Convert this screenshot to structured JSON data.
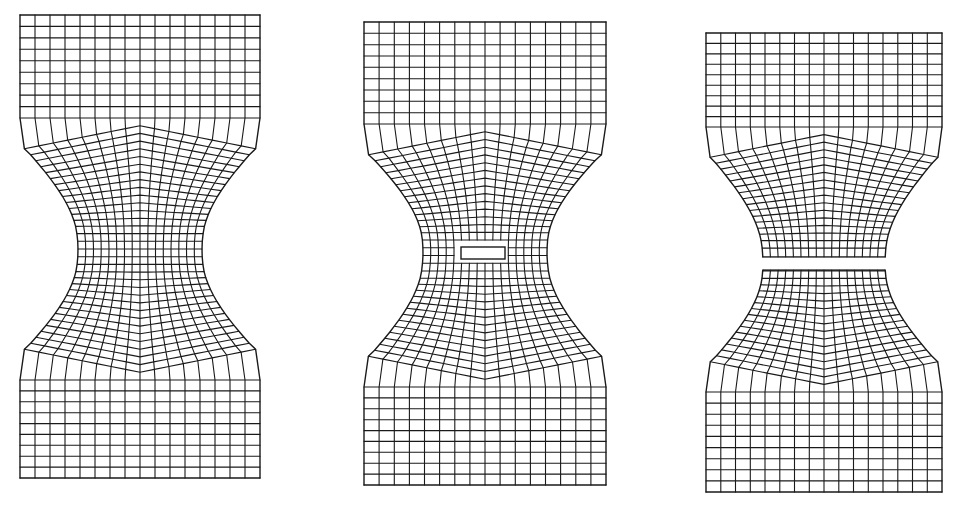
{
  "figure": {
    "width": 958,
    "height": 506,
    "background": "#ffffff",
    "stroke_color": "#1a1a1a",
    "stroke_width": 1.1,
    "outline_width": 1.4
  },
  "specimens": [
    {
      "id": "intact",
      "label": "Intact dog-bone specimen mesh",
      "x0": 20,
      "x1": 260,
      "y0": 15,
      "y1": 478,
      "shoulder_top": 118,
      "shoulder_bottom": 380,
      "waist_y": 250,
      "waist_inset": 58,
      "cols": 16,
      "grip_rows": 9,
      "defect": {
        "type": "none"
      }
    },
    {
      "id": "with-void",
      "label": "Specimen mesh with central void",
      "x0": 364,
      "x1": 606,
      "y0": 22,
      "y1": 485,
      "shoulder_top": 124,
      "shoulder_bottom": 387,
      "waist_y": 252,
      "waist_inset": 59,
      "cols": 16,
      "grip_rows": 9,
      "defect": {
        "type": "void",
        "x": 461,
        "y": 247,
        "w": 44,
        "h": 12
      }
    },
    {
      "id": "fractured",
      "label": "Fractured specimen mesh with transverse crack",
      "x0": 706,
      "x1": 942,
      "y0": 33,
      "y1": 492,
      "shoulder_top": 127,
      "shoulder_bottom": 392,
      "waist_y": 263,
      "waist_inset": 57,
      "cols": 16,
      "grip_rows": 9,
      "defect": {
        "type": "crack",
        "top": 257,
        "bottom": 270
      }
    }
  ]
}
